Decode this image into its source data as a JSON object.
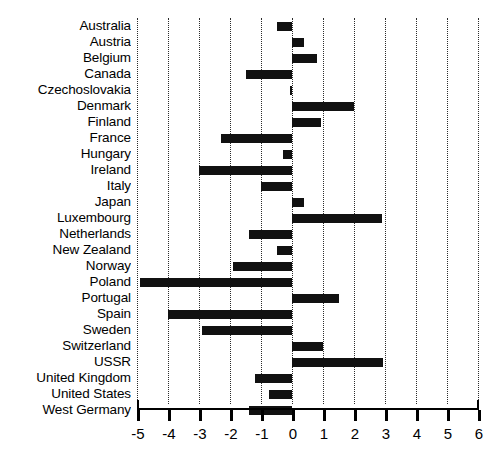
{
  "chart_data": {
    "type": "bar",
    "orientation": "horizontal",
    "title": "",
    "xlabel": "",
    "ylabel": "",
    "xlim": [
      -5,
      6
    ],
    "xticks": [
      -5,
      -4,
      -3,
      -2,
      -1,
      0,
      1,
      2,
      3,
      4,
      5,
      6
    ],
    "xtick_labels": [
      "-5",
      "-4",
      "-3",
      "-2",
      "-1",
      "0",
      "1",
      "2",
      "3",
      "4",
      "5",
      "6"
    ],
    "grid": true,
    "grid_style": "dotted-vertical",
    "legend": null,
    "bar_color": "#111111",
    "categories": [
      "Australia",
      "Austria",
      "Belgium",
      "Canada",
      "Czechoslovakia",
      "Denmark",
      "Finland",
      "France",
      "Hungary",
      "Ireland",
      "Italy",
      "Japan",
      "Luxembourg",
      "Netherlands",
      "New Zealand",
      "Norway",
      "Poland",
      "Portugal",
      "Spain",
      "Sweden",
      "Switzerland",
      "USSR",
      "United Kingdom",
      "United States",
      "West Germany"
    ],
    "values": [
      -0.5,
      0.4,
      0.8,
      -1.5,
      -0.05,
      2.0,
      0.95,
      -2.3,
      -0.3,
      -3.0,
      -1.0,
      0.4,
      2.9,
      -1.4,
      -0.5,
      -1.9,
      -4.9,
      1.5,
      -4.0,
      -2.9,
      1.0,
      2.95,
      -1.2,
      -0.75,
      -1.4
    ]
  }
}
